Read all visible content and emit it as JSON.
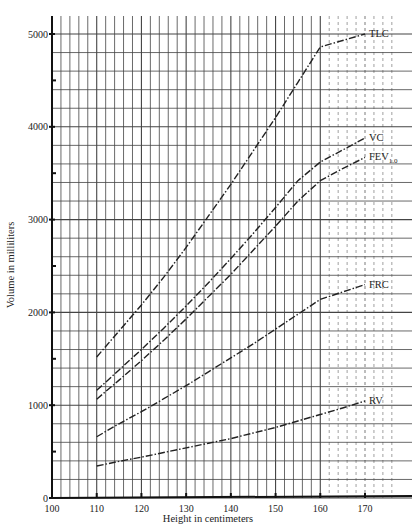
{
  "chart_data": {
    "type": "line",
    "title": "",
    "xlabel": "Height in centimeters",
    "ylabel": "Volume in milliliters",
    "xlim": [
      100,
      177
    ],
    "ylim": [
      0,
      5000
    ],
    "x_ticks": [
      100,
      110,
      120,
      130,
      140,
      150,
      160,
      170
    ],
    "y_ticks": [
      0,
      1000,
      2000,
      3000,
      4000,
      5000
    ],
    "grid": true,
    "legend": "inline labels at right end of each curve",
    "x": [
      110,
      115,
      120,
      125,
      130,
      135,
      140,
      145,
      150,
      155,
      160,
      165,
      170
    ],
    "series": [
      {
        "name": "TLC",
        "values": [
          1520,
          1800,
          2080,
          2380,
          2700,
          3040,
          3380,
          3740,
          4100,
          4480,
          4860,
          4930,
          5000
        ]
      },
      {
        "name": "VC",
        "values": [
          1160,
          1380,
          1600,
          1830,
          2070,
          2320,
          2580,
          2850,
          3130,
          3420,
          3620,
          3750,
          3880
        ]
      },
      {
        "name": "FEV1.0",
        "label_main": "FEV",
        "label_sub": "1.0",
        "values": [
          1065,
          1270,
          1480,
          1700,
          1930,
          2170,
          2410,
          2670,
          2930,
          3200,
          3420,
          3550,
          3670
        ]
      },
      {
        "name": "FRC",
        "values": [
          660,
          800,
          930,
          1070,
          1210,
          1360,
          1510,
          1660,
          1820,
          1980,
          2140,
          2220,
          2300
        ]
      },
      {
        "name": "RV",
        "values": [
          345,
          395,
          440,
          490,
          540,
          590,
          640,
          700,
          760,
          830,
          900,
          970,
          1045
        ]
      }
    ]
  }
}
